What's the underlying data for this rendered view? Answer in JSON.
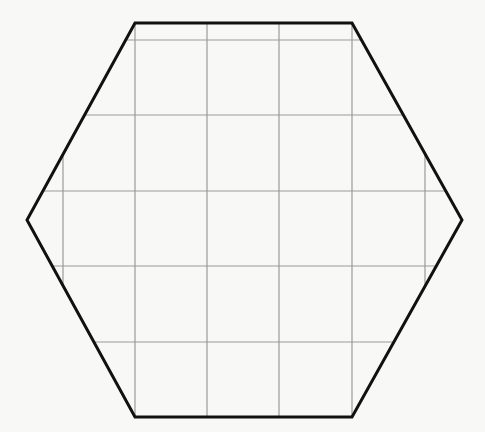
{
  "diagram": {
    "shape": "regular-hexagon",
    "orientation": "flat-top",
    "vertices": [
      [
        135,
        23
      ],
      [
        352,
        23
      ],
      [
        462,
        220
      ],
      [
        352,
        417
      ],
      [
        135,
        417
      ],
      [
        27,
        220
      ]
    ],
    "stroke_color": "#111111",
    "stroke_width": 3,
    "grid": {
      "color": "#9a9a9a",
      "line_width": 1.2,
      "vertical_lines_x": [
        63,
        135,
        207,
        279,
        352,
        425
      ],
      "horizontal_lines_y": [
        40,
        115,
        191,
        266,
        342
      ]
    }
  }
}
